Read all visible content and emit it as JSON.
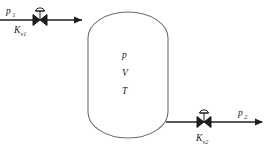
{
  "diagram": {
    "inlet": {
      "pressure_label": "p",
      "pressure_subscript": "1",
      "valve_label": "K",
      "valve_subscript": "v1",
      "flow_direction": "right"
    },
    "vessel": {
      "shape": "capsule",
      "variables": [
        {
          "symbol": "p",
          "name": "pressure"
        },
        {
          "symbol": "V",
          "name": "volume"
        },
        {
          "symbol": "T",
          "name": "temperature"
        }
      ]
    },
    "outlet": {
      "pressure_label": "p",
      "pressure_subscript": "2",
      "valve_label": "K",
      "valve_subscript": "v2",
      "flow_direction": "right"
    },
    "colors": {
      "line": "#1f1f1f",
      "vessel_outline": "#6d6d6d",
      "text": "#1a1a1a",
      "background": "#ffffff"
    }
  }
}
